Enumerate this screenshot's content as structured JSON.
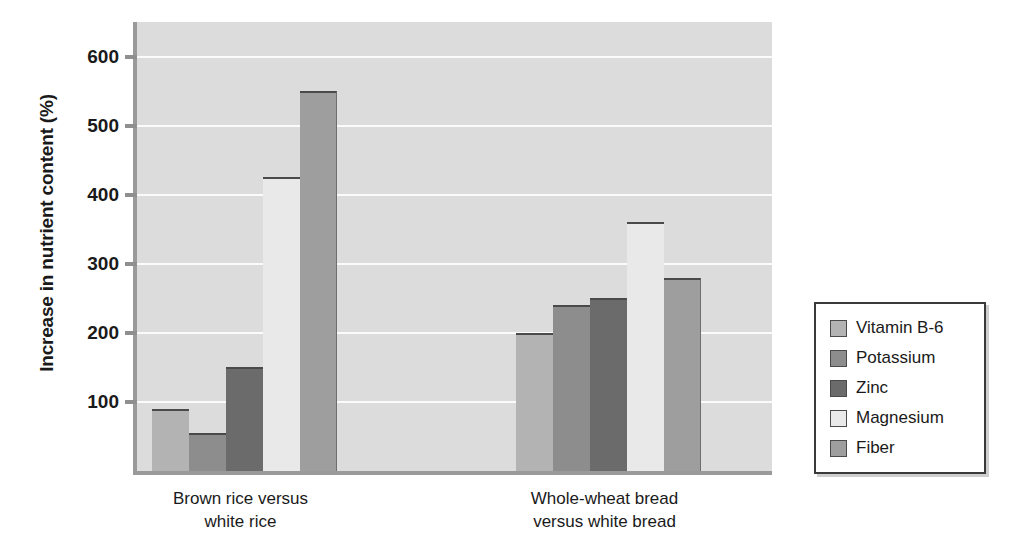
{
  "chart_data": {
    "type": "bar",
    "title": "",
    "xlabel": "",
    "ylabel": "Increase in nutrient content (%)",
    "ylim": [
      0,
      650
    ],
    "yticks": [
      100,
      200,
      300,
      400,
      500,
      600
    ],
    "ytick_labels": [
      "100",
      "200",
      "300",
      "400",
      "500",
      "600"
    ],
    "grid": true,
    "legend_position": "right",
    "categories": [
      "Brown rice versus white rice",
      "Whole-wheat bread versus white bread"
    ],
    "category_lines": [
      [
        "Brown rice versus",
        "white rice"
      ],
      [
        "Whole-wheat bread",
        "versus white bread"
      ]
    ],
    "series": [
      {
        "name": "Vitamin B-6",
        "color": "#b3b3b3",
        "values": [
          90,
          200
        ]
      },
      {
        "name": "Potassium",
        "color": "#8d8d8d",
        "values": [
          55,
          240
        ]
      },
      {
        "name": "Zinc",
        "color": "#6b6b6b",
        "values": [
          150,
          250
        ]
      },
      {
        "name": "Magnesium",
        "color": "#e9e9e9",
        "values": [
          425,
          360
        ]
      },
      {
        "name": "Fiber",
        "color": "#9e9e9e",
        "values": [
          550,
          280
        ]
      }
    ]
  },
  "legend": {
    "items": [
      {
        "label": "Vitamin B-6"
      },
      {
        "label": "Potassium"
      },
      {
        "label": "Zinc"
      },
      {
        "label": "Magnesium"
      },
      {
        "label": "Fiber"
      }
    ]
  },
  "colors": {
    "plot_background": "#dcdcdc",
    "gridline": "#fbfbfb",
    "axis": "#9a9a9a",
    "text": "#1a1a1a"
  }
}
